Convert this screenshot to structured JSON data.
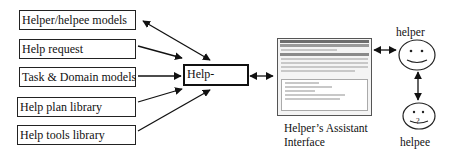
{
  "inputs": [
    {
      "label": "Helper/helpee models"
    },
    {
      "label": "Help request"
    },
    {
      "label": "Task & Domain models"
    },
    {
      "label": "Help plan library"
    },
    {
      "label": "Help tools library"
    }
  ],
  "hub": {
    "label": "Help-"
  },
  "interface": {
    "label_line1": "Helper’s Assistant",
    "label_line2": "Interface"
  },
  "actors": {
    "helper": "helper",
    "helpee": "helpee"
  },
  "colors": {
    "stroke": "#111111",
    "background": "#ffffff"
  }
}
